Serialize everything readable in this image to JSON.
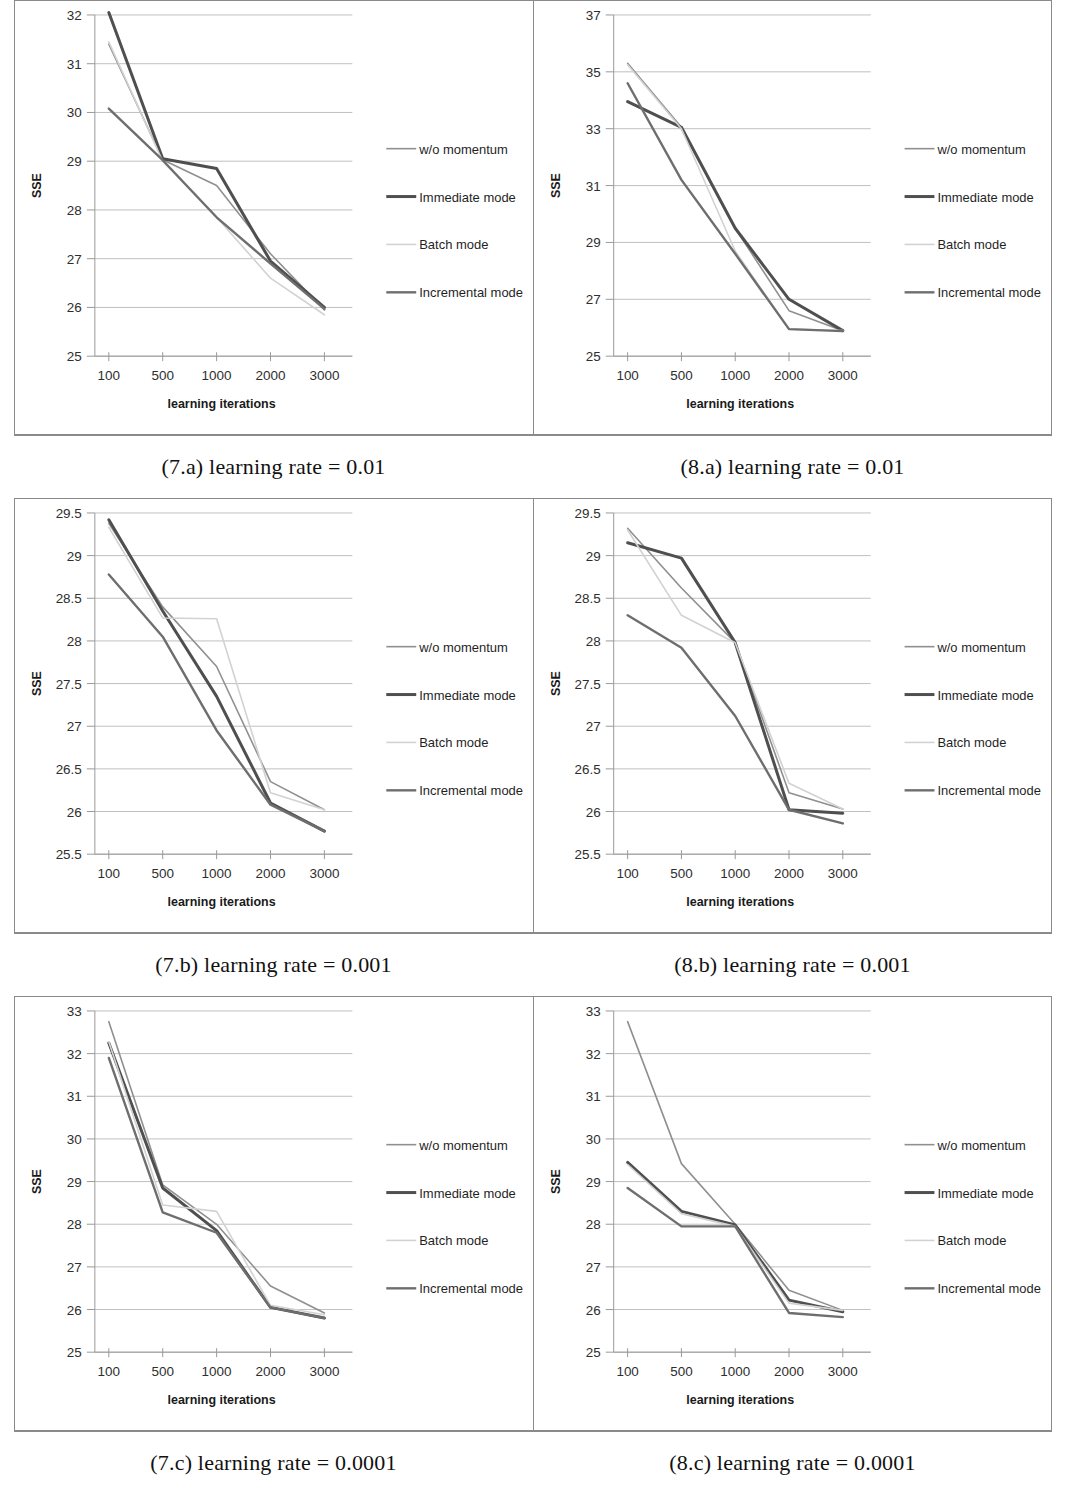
{
  "document": {
    "figure_columns": [
      "Figure 7",
      "Figure 8"
    ],
    "y_axis_title": "SSE",
    "x_axis_title": "learning iterations"
  },
  "legend": {
    "position": "right",
    "items": [
      {
        "label": "w/o momentum",
        "color": "#8f8f8f",
        "width": 1.6
      },
      {
        "label": "Immediate mode",
        "color": "#4f4f4f",
        "width": 3.0
      },
      {
        "label": "Batch mode",
        "color": "#d2d2d2",
        "width": 1.6
      },
      {
        "label": "Incremental mode",
        "color": "#6e6e6e",
        "width": 2.4
      }
    ]
  },
  "captions": [
    {
      "left": "(7.a) learning rate = 0.01",
      "right": "(8.a) learning rate = 0.01"
    },
    {
      "left": "(7.b) learning rate = 0.001",
      "right": "(8.b) learning rate = 0.001"
    },
    {
      "left": "(7.c) learning rate = 0.0001",
      "right": "(8.c) learning rate = 0.0001"
    }
  ],
  "footnote": "",
  "chart_data": [
    {
      "id": "fig7a",
      "type": "line",
      "title": "(7.a) learning rate = 0.01",
      "xlabel": "learning iterations",
      "ylabel": "SSE",
      "categories": [
        "100",
        "500",
        "1000",
        "2000",
        "3000"
      ],
      "yticks": [
        25,
        26,
        27,
        28,
        29,
        30,
        31,
        32
      ],
      "ylim": [
        25,
        32
      ],
      "grid": true,
      "series": [
        {
          "name": "w/o momentum",
          "values": [
            31.4,
            29.03,
            28.5,
            27.1,
            25.95
          ]
        },
        {
          "name": "Immediate mode",
          "values": [
            32.05,
            29.05,
            28.85,
            26.95,
            26.0
          ]
        },
        {
          "name": "Batch mode",
          "values": [
            31.45,
            29.0,
            27.85,
            26.6,
            25.85
          ]
        },
        {
          "name": "Incremental mode",
          "values": [
            30.08,
            29.02,
            27.85,
            26.9,
            25.97
          ]
        }
      ]
    },
    {
      "id": "fig8a",
      "type": "line",
      "title": "(8.a) learning rate = 0.01",
      "xlabel": "learning iterations",
      "ylabel": "SSE",
      "categories": [
        "100",
        "500",
        "1000",
        "2000",
        "3000"
      ],
      "yticks": [
        25,
        27,
        29,
        31,
        33,
        35,
        37
      ],
      "ylim": [
        25,
        37
      ],
      "grid": true,
      "series": [
        {
          "name": "w/o momentum",
          "values": [
            35.3,
            33.05,
            29.5,
            26.6,
            25.9
          ]
        },
        {
          "name": "Immediate mode",
          "values": [
            33.95,
            33.05,
            29.5,
            27.0,
            25.9
          ]
        },
        {
          "name": "Batch mode",
          "values": [
            35.25,
            33.0,
            28.7,
            25.95,
            25.9
          ]
        },
        {
          "name": "Incremental mode",
          "values": [
            34.6,
            31.2,
            28.6,
            25.95,
            25.88
          ]
        }
      ]
    },
    {
      "id": "fig7b",
      "type": "line",
      "title": "(7.b) learning rate = 0.001",
      "xlabel": "learning iterations",
      "ylabel": "SSE",
      "categories": [
        "100",
        "500",
        "1000",
        "2000",
        "3000"
      ],
      "yticks": [
        25.5,
        26,
        26.5,
        27,
        27.5,
        28,
        28.5,
        29,
        29.5
      ],
      "ylim": [
        25.5,
        29.5
      ],
      "grid": true,
      "series": [
        {
          "name": "w/o momentum",
          "values": [
            29.38,
            28.4,
            27.7,
            26.35,
            26.02
          ]
        },
        {
          "name": "Immediate mode",
          "values": [
            29.42,
            28.35,
            27.35,
            26.1,
            25.77
          ]
        },
        {
          "name": "Batch mode",
          "values": [
            29.33,
            28.27,
            28.26,
            26.22,
            26.02
          ]
        },
        {
          "name": "Incremental mode",
          "values": [
            28.78,
            28.05,
            26.95,
            26.08,
            25.77
          ]
        }
      ]
    },
    {
      "id": "fig8b",
      "type": "line",
      "title": "(8.b) learning rate = 0.001",
      "xlabel": "learning iterations",
      "ylabel": "SSE",
      "categories": [
        "100",
        "500",
        "1000",
        "2000",
        "3000"
      ],
      "yticks": [
        25.5,
        26,
        26.5,
        27,
        27.5,
        28,
        28.5,
        29,
        29.5
      ],
      "ylim": [
        25.5,
        29.5
      ],
      "grid": true,
      "series": [
        {
          "name": "w/o momentum",
          "values": [
            29.32,
            28.62,
            27.98,
            26.22,
            26.03
          ]
        },
        {
          "name": "Immediate mode",
          "values": [
            29.15,
            28.97,
            27.98,
            26.02,
            25.98
          ]
        },
        {
          "name": "Batch mode",
          "values": [
            29.3,
            28.3,
            27.98,
            26.33,
            26.03
          ]
        },
        {
          "name": "Incremental mode",
          "values": [
            28.3,
            27.92,
            27.12,
            26.02,
            25.86
          ]
        }
      ]
    },
    {
      "id": "fig7c",
      "type": "line",
      "title": "(7.c) learning rate = 0.0001",
      "xlabel": "learning iterations",
      "ylabel": "SSE",
      "categories": [
        "100",
        "500",
        "1000",
        "2000",
        "3000"
      ],
      "yticks": [
        25,
        26,
        27,
        28,
        29,
        30,
        31,
        32,
        33
      ],
      "ylim": [
        25,
        33
      ],
      "grid": true,
      "series": [
        {
          "name": "w/o momentum",
          "values": [
            32.75,
            28.92,
            28.0,
            26.55,
            25.92
          ]
        },
        {
          "name": "Immediate mode",
          "values": [
            32.25,
            28.85,
            27.85,
            26.05,
            25.8
          ]
        },
        {
          "name": "Batch mode",
          "values": [
            32.28,
            28.45,
            28.3,
            26.1,
            25.88
          ]
        },
        {
          "name": "Incremental mode",
          "values": [
            31.9,
            28.28,
            27.8,
            26.05,
            25.8
          ]
        }
      ]
    },
    {
      "id": "fig8c",
      "type": "line",
      "title": "(8.c) learning rate = 0.0001",
      "xlabel": "learning iterations",
      "ylabel": "SSE",
      "categories": [
        "100",
        "500",
        "1000",
        "2000",
        "3000"
      ],
      "yticks": [
        25,
        26,
        27,
        28,
        29,
        30,
        31,
        32,
        33
      ],
      "ylim": [
        25,
        33
      ],
      "grid": true,
      "series": [
        {
          "name": "w/o momentum",
          "values": [
            32.75,
            29.42,
            28.0,
            26.45,
            25.98
          ]
        },
        {
          "name": "Immediate mode",
          "values": [
            29.45,
            28.3,
            27.98,
            26.22,
            25.95
          ]
        },
        {
          "name": "Batch mode",
          "values": [
            29.4,
            28.25,
            27.95,
            26.15,
            25.98
          ]
        },
        {
          "name": "Incremental mode",
          "values": [
            28.85,
            27.95,
            27.95,
            25.92,
            25.82
          ]
        }
      ]
    }
  ]
}
